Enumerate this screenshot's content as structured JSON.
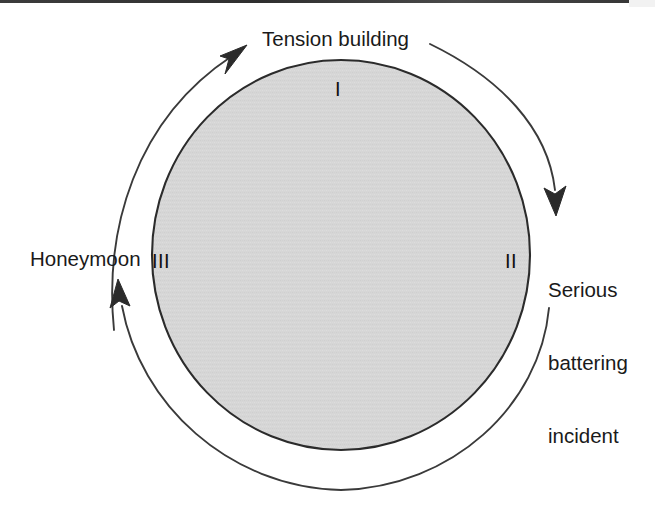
{
  "diagram": {
    "title_label": "Tension building",
    "phases": [
      {
        "numeral": "I",
        "name": "Tension building",
        "position": "top"
      },
      {
        "numeral": "II",
        "name": "Serious battering incident",
        "position": "right"
      },
      {
        "numeral": "III",
        "name": "Honeymoon",
        "position": "left"
      }
    ],
    "labels": {
      "tension_building": "Tension building",
      "serious_line1": "Serious",
      "serious_line2": "battering",
      "serious_line3": "incident",
      "honeymoon": "Honeymoon"
    },
    "numerals": {
      "one": "I",
      "two": "II",
      "three": "III"
    },
    "colors": {
      "circle_fill": "#d5d5d5",
      "circle_stroke": "#2b2b2b",
      "arc_stroke": "#3a3a3a",
      "text": "#1a1a1a",
      "background": "#ffffff"
    },
    "geometry": {
      "circle_center_x": 341,
      "circle_center_y": 255,
      "circle_radius_x": 189,
      "circle_radius_y": 195,
      "outer_arc_radius_x": 228,
      "outer_arc_radius_y": 235
    },
    "arrows": [
      {
        "name": "honeymoon-to-tension",
        "direction": "clockwise",
        "head": "up-right",
        "head_x": 240,
        "head_y": 48
      },
      {
        "name": "tension-to-battering",
        "direction": "clockwise",
        "head": "down",
        "head_x": 556,
        "head_y": 212
      },
      {
        "name": "battering-to-honeymoon",
        "direction": "clockwise",
        "head": "up",
        "head_x": 119,
        "head_y": 283
      }
    ]
  }
}
